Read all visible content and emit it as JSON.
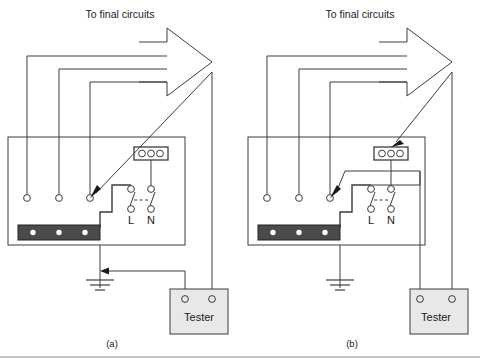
{
  "figure": {
    "title_label": "To final circuits",
    "caption_a": "(a)",
    "caption_b": "(b)",
    "tester_label": "Tester",
    "line_label": "L",
    "neutral_label": "N",
    "colors": {
      "stroke": "#3c3c3c",
      "neutral_bar_fill": "#4a4a4a",
      "neutral_bar_stroke": "#222222",
      "tester_fill": "#e8e8e8",
      "terminal_block_fill": "#ffffff",
      "background": "#ffffff",
      "text": "#1a1a1a"
    },
    "panels": [
      {
        "id": "a",
        "caption": "(a)",
        "arrow_label": "To final circuits",
        "final_circuit_count": 3,
        "consumer_unit_terminals": 3,
        "earth_terminal_block_ways": 3,
        "neutral_bar_ways": 3,
        "switch_poles": [
          "L",
          "N"
        ],
        "tester_label": "Tester",
        "tester_terminals": 2,
        "probe_target": "circuit-protective-conductor-terminal",
        "earth_arrow": true
      },
      {
        "id": "b",
        "caption": "(b)",
        "arrow_label": "To final circuits",
        "final_circuit_count": 3,
        "consumer_unit_terminals": 3,
        "earth_terminal_block_ways": 3,
        "neutral_bar_ways": 3,
        "switch_poles": [
          "L",
          "N"
        ],
        "tester_label": "Tester",
        "tester_terminals": 2,
        "probe_target": "earth-terminal-block",
        "earth_arrow": false
      }
    ]
  }
}
